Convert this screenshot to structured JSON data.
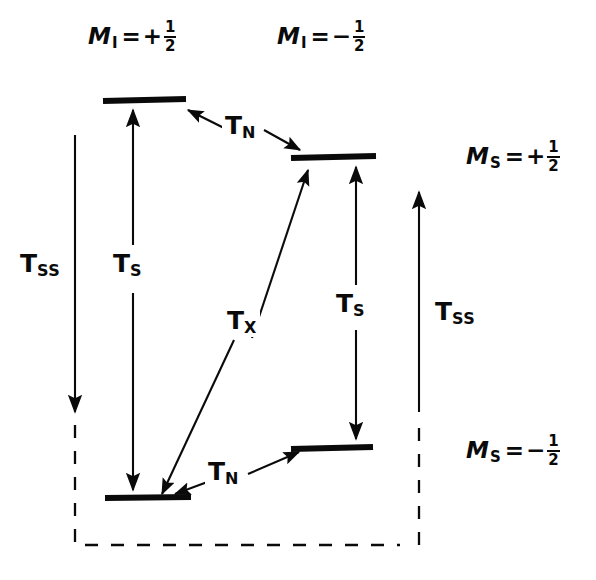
{
  "figure": {
    "background_color": "#ffffff",
    "ink_color": "#0a0a0a"
  },
  "column_labels": [
    {
      "symbol": "M",
      "subscript": "I",
      "equals": "=",
      "sign": "+",
      "numerator": "1",
      "denominator": "2"
    },
    {
      "symbol": "M",
      "subscript": "I",
      "equals": "=",
      "sign": "−",
      "numerator": "1",
      "denominator": "2"
    }
  ],
  "row_labels": [
    {
      "symbol": "M",
      "subscript": "S",
      "equals": "=",
      "sign": "+",
      "numerator": "1",
      "denominator": "2"
    },
    {
      "symbol": "M",
      "subscript": "S",
      "equals": "=",
      "sign": "−",
      "numerator": "1",
      "denominator": "2"
    }
  ],
  "levels": [
    {
      "id": "upper-left",
      "name": "level-upper-left"
    },
    {
      "id": "upper-right",
      "name": "level-upper-right"
    },
    {
      "id": "lower-left",
      "name": "level-lower-left"
    },
    {
      "id": "lower-right",
      "name": "level-lower-right"
    }
  ],
  "transitions": [
    {
      "id": "ts-left",
      "symbol": "T",
      "subscript": "S"
    },
    {
      "id": "ts-right",
      "symbol": "T",
      "subscript": "S"
    },
    {
      "id": "tn-upper",
      "symbol": "T",
      "subscript": "N"
    },
    {
      "id": "tn-lower",
      "symbol": "T",
      "subscript": "N"
    },
    {
      "id": "tx-diagonal",
      "symbol": "T",
      "subscript": "X"
    },
    {
      "id": "tss-left",
      "symbol": "T",
      "subscript": "SS"
    },
    {
      "id": "tss-right",
      "symbol": "T",
      "subscript": "SS"
    }
  ]
}
